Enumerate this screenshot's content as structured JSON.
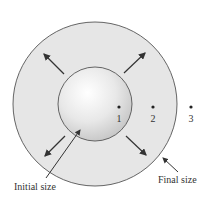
{
  "diagram": {
    "type": "expansion-diagram",
    "outer_circle": {
      "label": "Final size",
      "fill": "#e6e6e6",
      "stroke": "#555555"
    },
    "inner_circle": {
      "label": "Initial size",
      "fill": "#eeeeee",
      "stroke": "#555555"
    },
    "points": [
      {
        "label": "1"
      },
      {
        "label": "2"
      },
      {
        "label": "3"
      }
    ],
    "arrows": [
      "up-left",
      "up-right",
      "down-left",
      "down-right"
    ]
  }
}
